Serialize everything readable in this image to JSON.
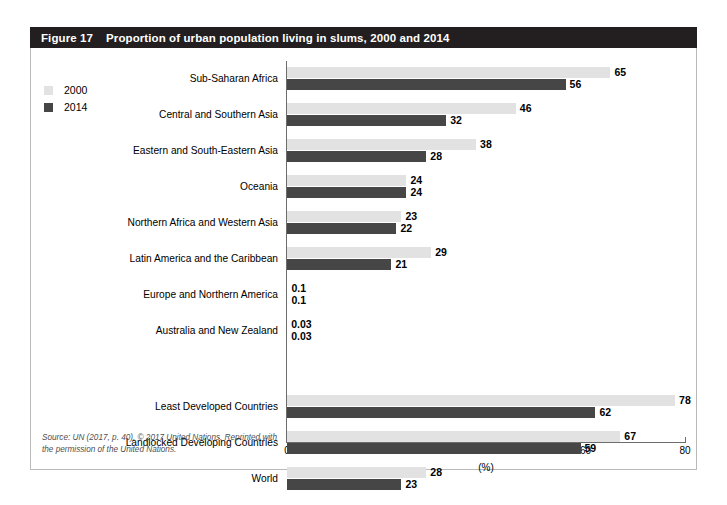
{
  "figure": {
    "number": "Figure 17",
    "title": "Proportion of urban population living in slums, 2000 and 2014",
    "source_note": "Source: UN (2017, p. 40). © 2017 United Nations. Reprinted with the permission of the United Nations."
  },
  "colors": {
    "header_band": "#231f20",
    "series_2000": "#e2e2e2",
    "series_2014": "#464646",
    "axis": "#6d6d6d",
    "frame": "#b9b9b9"
  },
  "legend": {
    "items": [
      {
        "label": "2000",
        "color": "#e2e2e2"
      },
      {
        "label": "2014",
        "color": "#464646"
      }
    ]
  },
  "chart_data": {
    "type": "bar",
    "orientation": "horizontal",
    "title": "Proportion of urban population living in slums, 2000 and 2014",
    "xlabel": "(%)",
    "ylabel": "",
    "xlim": [
      0,
      80
    ],
    "xticks": [
      0,
      20,
      40,
      60,
      80
    ],
    "xtick_labels": [
      "0",
      "20",
      "40",
      "60",
      "80"
    ],
    "grid": false,
    "legend_position": "top-left",
    "categories": [
      "Sub-Saharan Africa",
      "Central and Southern Asia",
      "Eastern and South-Eastern Asia",
      "Oceania",
      "Northern Africa and Western Asia",
      "Latin America and the Caribbean",
      "Europe and Northern America",
      "Australia and New Zealand",
      "Least Developed Countries",
      "Landlocked Developing Countries",
      "World"
    ],
    "series": [
      {
        "name": "2000",
        "values": [
          65,
          46,
          38,
          24,
          23,
          29,
          0.1,
          0.03,
          78,
          67,
          28
        ],
        "labels": [
          "65",
          "46",
          "38",
          "24",
          "23",
          "29",
          "0.1",
          "0.03",
          "78",
          "67",
          "28"
        ]
      },
      {
        "name": "2014",
        "values": [
          56,
          32,
          28,
          24,
          22,
          21,
          0.1,
          0.03,
          62,
          59,
          23
        ],
        "labels": [
          "56",
          "32",
          "28",
          "24",
          "22",
          "21",
          "0.1",
          "0.03",
          "62",
          "59",
          "23"
        ]
      }
    ],
    "group_break_after_index": 7
  }
}
